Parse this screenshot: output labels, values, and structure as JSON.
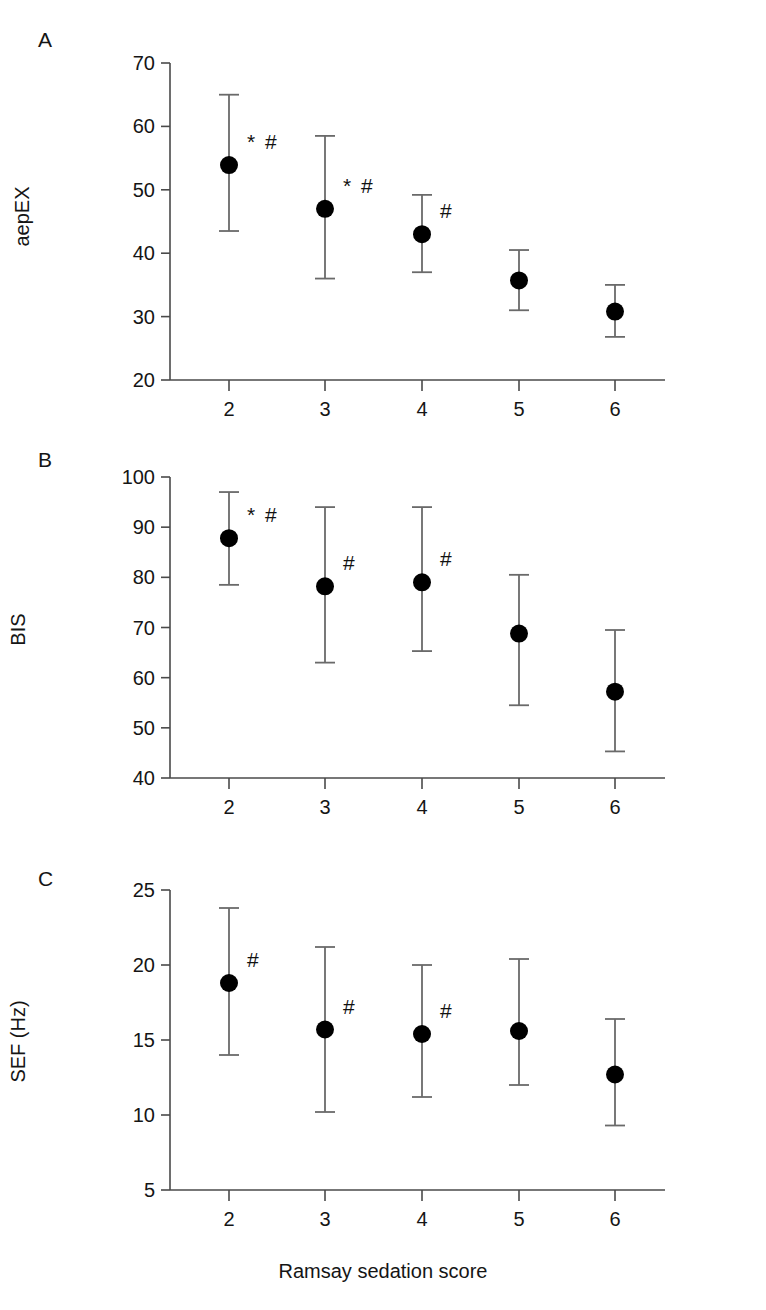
{
  "figure": {
    "xlabel": "Ramsay sedation score",
    "xticks": [
      "2",
      "3",
      "4",
      "5",
      "6"
    ],
    "panel_letters": [
      "A",
      "B",
      "C"
    ]
  },
  "chart_data": [
    {
      "type": "scatter",
      "panel": "A",
      "title": "",
      "xlabel": "Ramsay sedation score",
      "ylabel": "aepEX",
      "x": [
        2,
        3,
        4,
        5,
        6
      ],
      "xticklabels": [
        "2",
        "3",
        "4",
        "5",
        "6"
      ],
      "yticklabels": [
        "20",
        "30",
        "40",
        "50",
        "60",
        "70"
      ],
      "yticks": [
        20,
        30,
        40,
        50,
        60,
        70
      ],
      "ylim": [
        20,
        70
      ],
      "xlim": [
        1.4,
        6.6
      ],
      "grid": false,
      "legend": null,
      "values": [
        53.9,
        47.0,
        43.0,
        35.7,
        30.8
      ],
      "err_low": [
        43.5,
        36.0,
        37.0,
        31.0,
        26.8
      ],
      "err_high": [
        65.0,
        58.5,
        49.2,
        40.5,
        35.0
      ],
      "annotations": [
        "* #",
        "* #",
        "#",
        "",
        ""
      ]
    },
    {
      "type": "scatter",
      "panel": "B",
      "title": "",
      "xlabel": "Ramsay sedation score",
      "ylabel": "BIS",
      "x": [
        2,
        3,
        4,
        5,
        6
      ],
      "xticklabels": [
        "2",
        "3",
        "4",
        "5",
        "6"
      ],
      "yticklabels": [
        "40",
        "50",
        "60",
        "70",
        "80",
        "90",
        "100"
      ],
      "yticks": [
        40,
        50,
        60,
        70,
        80,
        90,
        100
      ],
      "ylim": [
        40,
        100
      ],
      "xlim": [
        1.4,
        6.6
      ],
      "grid": false,
      "legend": null,
      "values": [
        87.8,
        78.2,
        79.0,
        68.8,
        57.2
      ],
      "err_low": [
        78.5,
        63.0,
        65.3,
        54.5,
        45.3
      ],
      "err_high": [
        97.0,
        94.0,
        94.0,
        80.5,
        69.5
      ],
      "annotations": [
        "* #",
        "#",
        "#",
        "",
        ""
      ]
    },
    {
      "type": "scatter",
      "panel": "C",
      "title": "",
      "xlabel": "Ramsay sedation score",
      "ylabel": "SEF  (Hz)",
      "x": [
        2,
        3,
        4,
        5,
        6
      ],
      "xticklabels": [
        "2",
        "3",
        "4",
        "5",
        "6"
      ],
      "yticklabels": [
        "5",
        "10",
        "15",
        "20",
        "25"
      ],
      "yticks": [
        5,
        10,
        15,
        20,
        25
      ],
      "ylim": [
        5,
        25
      ],
      "xlim": [
        1.4,
        6.6
      ],
      "grid": false,
      "legend": null,
      "values": [
        18.8,
        15.7,
        15.4,
        15.6,
        12.7
      ],
      "err_low": [
        14.0,
        10.2,
        11.2,
        12.0,
        9.3
      ],
      "err_high": [
        23.8,
        21.2,
        20.0,
        20.4,
        16.4
      ],
      "annotations": [
        "#",
        "#",
        "#",
        "",
        ""
      ]
    }
  ],
  "colors": {
    "marker": "#000000",
    "axis": "#4a4a4a",
    "error_bar": "#6a6a6a",
    "text": "#151515",
    "background": "#ffffff"
  }
}
